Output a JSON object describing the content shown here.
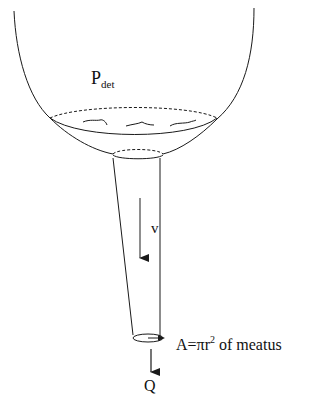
{
  "diagram": {
    "type": "bladder-urethra-flow-schematic",
    "labels": {
      "pressure_main": "P",
      "pressure_sub": "det",
      "velocity": "v",
      "area_prefix": "A=πr",
      "area_exp": "2",
      "area_suffix": " of meatus",
      "flow": "Q"
    },
    "colors": {
      "line": "#1a1a1a",
      "arrow": "#555555",
      "background": "#ffffff"
    }
  }
}
